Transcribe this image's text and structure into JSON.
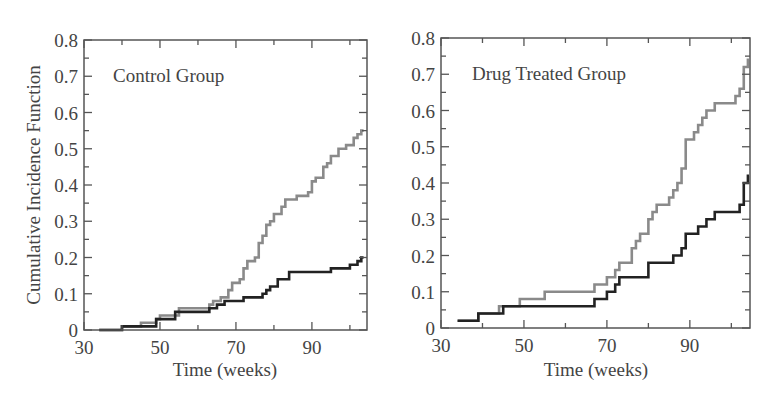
{
  "figure": {
    "ylabel": "Cumulative Incidence Function",
    "colors": {
      "frame": "#555555",
      "series_gray": "#8a8a8a",
      "series_black": "#222222"
    }
  },
  "chart_data": [
    {
      "type": "line",
      "step": true,
      "title": "Control Group",
      "xlabel": "Time (weeks)",
      "ylabel": "Cumulative Incidence Function",
      "xlim": [
        30,
        104.5
      ],
      "ylim": [
        0,
        0.8
      ],
      "xticks": [
        30,
        50,
        70,
        90
      ],
      "yticks": [
        0,
        0.1,
        0.2,
        0.3,
        0.4,
        0.5,
        0.6,
        0.7,
        0.8
      ],
      "ytick_labels": [
        "0",
        "0.1",
        "0.2",
        "0.3",
        "0.4",
        "0.5",
        "0.6",
        "0.7",
        "0.8"
      ],
      "grid": false,
      "series": [
        {
          "name": "gray curve",
          "color": "#8a8a8a",
          "x": [
            34,
            40,
            45,
            49,
            50,
            55,
            63,
            64,
            66,
            68,
            69,
            71,
            72,
            73,
            75,
            76,
            77,
            78,
            79,
            80,
            82,
            83,
            86,
            89,
            90,
            91,
            93,
            94,
            95,
            97,
            99,
            101,
            102,
            103
          ],
          "y": [
            0,
            0.01,
            0.02,
            0.03,
            0.04,
            0.06,
            0.07,
            0.08,
            0.09,
            0.11,
            0.13,
            0.14,
            0.17,
            0.19,
            0.2,
            0.24,
            0.26,
            0.29,
            0.3,
            0.32,
            0.34,
            0.36,
            0.37,
            0.38,
            0.41,
            0.42,
            0.45,
            0.46,
            0.48,
            0.5,
            0.51,
            0.53,
            0.54,
            0.55
          ]
        },
        {
          "name": "black curve",
          "color": "#222222",
          "x": [
            34,
            40,
            49,
            54,
            63,
            65,
            67,
            72,
            77,
            78,
            79,
            81,
            84,
            95,
            100,
            102,
            103
          ],
          "y": [
            0,
            0.01,
            0.03,
            0.05,
            0.06,
            0.07,
            0.08,
            0.09,
            0.1,
            0.11,
            0.12,
            0.14,
            0.16,
            0.17,
            0.18,
            0.19,
            0.2
          ]
        }
      ]
    },
    {
      "type": "line",
      "step": true,
      "title": "Drug Treated Group",
      "xlabel": "Time (weeks)",
      "ylabel": "",
      "xlim": [
        30,
        104.5
      ],
      "ylim": [
        0,
        0.8
      ],
      "xticks": [
        30,
        50,
        70,
        90
      ],
      "yticks": [
        0,
        0.1,
        0.2,
        0.3,
        0.4,
        0.5,
        0.6,
        0.7,
        0.8
      ],
      "ytick_labels": [
        "0",
        "0.1",
        "0.2",
        "0.3",
        "0.4",
        "0.5",
        "0.6",
        "0.7",
        "0.8"
      ],
      "grid": false,
      "series": [
        {
          "name": "gray curve",
          "color": "#8a8a8a",
          "x": [
            34,
            39,
            44,
            49,
            55,
            67,
            70,
            72,
            73,
            76,
            77,
            78,
            80,
            81,
            82,
            85,
            86,
            87,
            88,
            89,
            91,
            92,
            93,
            94,
            96,
            101,
            102,
            103,
            104
          ],
          "y": [
            0.02,
            0.04,
            0.06,
            0.08,
            0.1,
            0.12,
            0.14,
            0.16,
            0.18,
            0.22,
            0.24,
            0.26,
            0.3,
            0.32,
            0.34,
            0.36,
            0.38,
            0.4,
            0.44,
            0.52,
            0.54,
            0.56,
            0.58,
            0.6,
            0.62,
            0.64,
            0.66,
            0.72,
            0.74
          ]
        },
        {
          "name": "black curve",
          "color": "#222222",
          "x": [
            34,
            39,
            45,
            67,
            70,
            72,
            73,
            80,
            86,
            88,
            89,
            92,
            94,
            96,
            102,
            103,
            104
          ],
          "y": [
            0.02,
            0.04,
            0.06,
            0.08,
            0.1,
            0.12,
            0.14,
            0.18,
            0.2,
            0.22,
            0.26,
            0.28,
            0.3,
            0.32,
            0.34,
            0.4,
            0.42
          ]
        }
      ]
    }
  ]
}
